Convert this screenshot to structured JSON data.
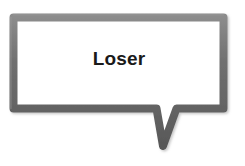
{
  "graphic": {
    "kind": "speech-bubble",
    "shape": "rectangular-callout-with-v-tail",
    "background_color": "#ffffff",
    "stroke_color": "#6b6b6b",
    "stroke_highlight_color": "#8a8a8a",
    "stroke_shadow_color": "#575757",
    "fill_color": "#ffffff",
    "text_color": "#1a1a1a",
    "stroke_width_px": 8,
    "bubble_bounds": {
      "x": 9,
      "y": 13,
      "width": 219,
      "height": 100
    },
    "tail": {
      "left_x": 152,
      "right_x": 180,
      "tip_x": 163,
      "tip_y": 150
    }
  },
  "bubble": {
    "message": "Loser"
  }
}
